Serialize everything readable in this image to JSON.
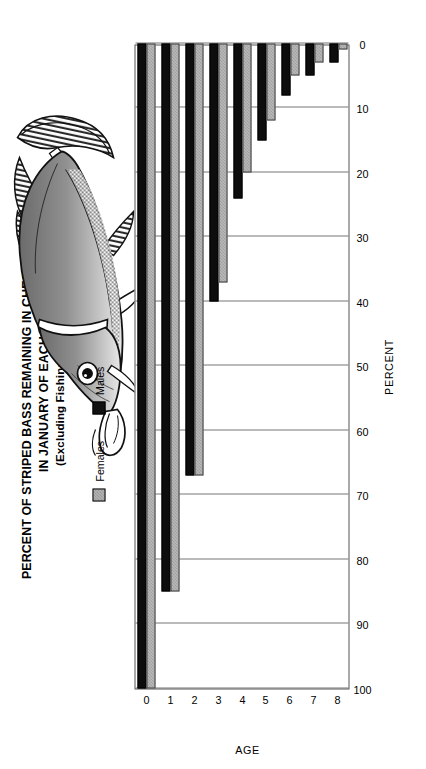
{
  "figure": {
    "title_lines": [
      "PERCENT OF STRIPED BASS REMAINING IN CHESAPEAKE BAY",
      "IN JANUARY OF EACH YEAR",
      "(Excluding Fishing Mortality)"
    ],
    "illustration": "striped-bass-fish-illustration"
  },
  "legend": {
    "position": "top-left-inside",
    "items": [
      {
        "label": "Females",
        "swatch": "gray-hatched-swatch",
        "color": "#b8b8b8"
      },
      {
        "label": "Males",
        "swatch": "black-swatch",
        "color": "#0d0d0d"
      }
    ]
  },
  "chart_data": {
    "type": "bar",
    "orientation": "vertical",
    "title": "PERCENT OF STRIPED BASS REMAINING IN CHESAPEAKE BAY IN JANUARY OF EACH YEAR (Excluding Fishing Mortality)",
    "subtitle": "(Excluding Fishing Mortality)",
    "xlabel": "AGE",
    "ylabel": "PERCENT",
    "categories": [
      "0",
      "1",
      "2",
      "3",
      "4",
      "5",
      "6",
      "7",
      "8"
    ],
    "xticklabels": [
      "0",
      "1",
      "2",
      "3",
      "4",
      "5",
      "6",
      "7",
      "8"
    ],
    "yticklabels": [
      "0",
      "10",
      "20",
      "30",
      "40",
      "50",
      "60",
      "70",
      "80",
      "90",
      "100"
    ],
    "ylim": [
      0,
      100
    ],
    "ytick_step": 10,
    "grid": true,
    "grid_axis": "y",
    "legend_position": "upper-left",
    "series": [
      {
        "name": "Females",
        "color": "#b8b8b8",
        "values": [
          100,
          85,
          67,
          37,
          20,
          12,
          5,
          3,
          1
        ]
      },
      {
        "name": "Males",
        "color": "#0d0d0d",
        "values": [
          100,
          85,
          67,
          40,
          24,
          15,
          8,
          5,
          3
        ]
      }
    ]
  }
}
